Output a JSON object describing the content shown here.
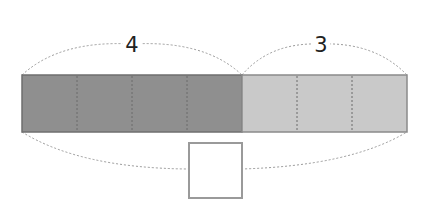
{
  "diagram": {
    "type": "tape-diagram",
    "left_segment": {
      "label": "4",
      "parts": 4,
      "color": "#8f8f8f"
    },
    "right_segment": {
      "label": "3",
      "parts": 3,
      "color": "#c9c9c9"
    },
    "total_label": "",
    "border_color": "#7a7a7a",
    "brace_color": "#9a9a9a"
  }
}
